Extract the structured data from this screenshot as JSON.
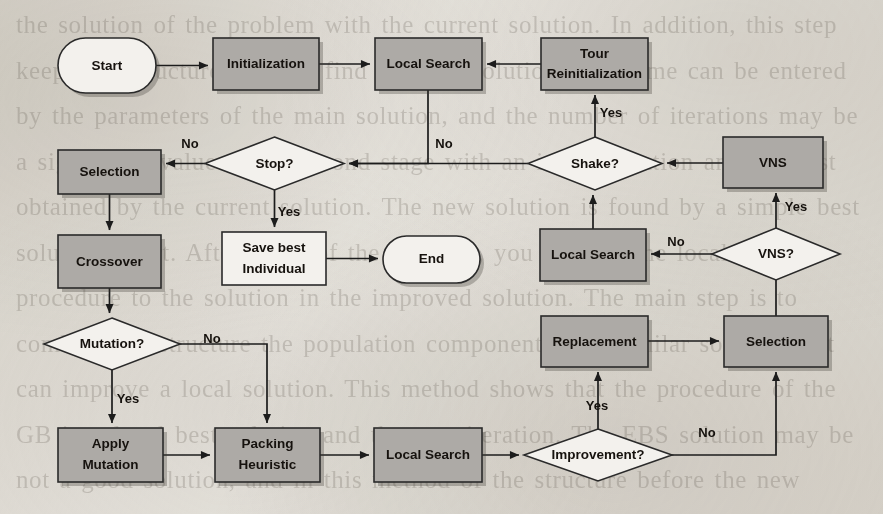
{
  "diagram": {
    "type": "flowchart",
    "background_color": "#eceae5",
    "process_fill_color": "#adaaa6",
    "terminal_fill_color": "#f3f1ed",
    "decision_fill_color": "#f3f1ed",
    "line_color": "#1c1c1c"
  },
  "nodes": [
    {
      "id": "start",
      "label": "Start",
      "shape": "terminal",
      "fill": "white",
      "x": 58,
      "y": 38,
      "w": 98,
      "h": 55
    },
    {
      "id": "init",
      "label": "Initialization",
      "shape": "process",
      "fill": "gray",
      "x": 213,
      "y": 38,
      "w": 106,
      "h": 52
    },
    {
      "id": "ls_top",
      "label": "Local Search",
      "shape": "process",
      "fill": "gray",
      "x": 375,
      "y": 38,
      "w": 107,
      "h": 52
    },
    {
      "id": "tour_reinit",
      "label_line1": "Tour",
      "label_line2": "Reinitialization",
      "label": "Tour Reinitialization",
      "shape": "process",
      "fill": "gray",
      "x": 541,
      "y": 38,
      "w": 107,
      "h": 52
    },
    {
      "id": "selection_l",
      "label": "Selection",
      "shape": "process",
      "fill": "gray",
      "x": 58,
      "y": 150,
      "w": 103,
      "h": 44
    },
    {
      "id": "stop",
      "label": "Stop?",
      "shape": "decision",
      "fill": "white",
      "x": 205,
      "y": 137,
      "w": 139,
      "h": 53
    },
    {
      "id": "shake",
      "label": "Shake?",
      "shape": "decision",
      "fill": "white",
      "x": 528,
      "y": 137,
      "w": 134,
      "h": 53
    },
    {
      "id": "vns",
      "label": "VNS",
      "shape": "process",
      "fill": "gray",
      "x": 723,
      "y": 137,
      "w": 100,
      "h": 51
    },
    {
      "id": "crossover",
      "label": "Crossover",
      "shape": "process",
      "fill": "gray",
      "x": 58,
      "y": 235,
      "w": 103,
      "h": 53
    },
    {
      "id": "save_best",
      "label_line1": "Save best",
      "label_line2": "Individual",
      "label": "Save best Individual",
      "shape": "process",
      "fill": "white",
      "x": 222,
      "y": 232,
      "w": 104,
      "h": 53
    },
    {
      "id": "end",
      "label": "End",
      "shape": "terminal",
      "fill": "white",
      "x": 383,
      "y": 236,
      "w": 97,
      "h": 47
    },
    {
      "id": "ls_mid",
      "label": "Local Search",
      "shape": "process",
      "fill": "gray",
      "x": 540,
      "y": 229,
      "w": 106,
      "h": 52
    },
    {
      "id": "vns_q",
      "label": "VNS?",
      "shape": "decision",
      "fill": "white",
      "x": 712,
      "y": 228,
      "w": 128,
      "h": 52
    },
    {
      "id": "mutation_q",
      "label": "Mutation?",
      "shape": "decision",
      "fill": "white",
      "x": 44,
      "y": 318,
      "w": 136,
      "h": 52
    },
    {
      "id": "replacement",
      "label": "Replacement",
      "shape": "process",
      "fill": "gray",
      "x": 541,
      "y": 316,
      "w": 107,
      "h": 51
    },
    {
      "id": "selection_r",
      "label": "Selection",
      "shape": "process",
      "fill": "gray",
      "x": 724,
      "y": 316,
      "w": 104,
      "h": 51
    },
    {
      "id": "apply_mut",
      "label_line1": "Apply",
      "label_line2": "Mutation",
      "label": "Apply Mutation",
      "shape": "process",
      "fill": "gray",
      "x": 58,
      "y": 428,
      "w": 105,
      "h": 54
    },
    {
      "id": "packing",
      "label_line1": "Packing",
      "label_line2": "Heuristic",
      "label": "Packing Heuristic",
      "shape": "process",
      "fill": "gray",
      "x": 215,
      "y": 428,
      "w": 105,
      "h": 54
    },
    {
      "id": "ls_bot",
      "label": "Local Search",
      "shape": "process",
      "fill": "gray",
      "x": 374,
      "y": 428,
      "w": 108,
      "h": 54
    },
    {
      "id": "improvement",
      "label": "Improvement?",
      "shape": "decision",
      "fill": "white",
      "x": 524,
      "y": 429,
      "w": 148,
      "h": 52
    }
  ],
  "edge_labels": [
    {
      "id": "stop-no",
      "text": "No",
      "x": 190,
      "y": 145
    },
    {
      "id": "stop-yes",
      "text": "Yes",
      "x": 289,
      "y": 213
    },
    {
      "id": "shake-no",
      "text": "No",
      "x": 444,
      "y": 145
    },
    {
      "id": "shake-yes",
      "text": "Yes",
      "x": 611,
      "y": 114
    },
    {
      "id": "vnsq-no",
      "text": "No",
      "x": 676,
      "y": 243
    },
    {
      "id": "vnsq-yes",
      "text": "Yes",
      "x": 796,
      "y": 208
    },
    {
      "id": "mutation-no",
      "text": "No",
      "x": 212,
      "y": 340
    },
    {
      "id": "mutation-yes",
      "text": "Yes",
      "x": 128,
      "y": 400
    },
    {
      "id": "improvement-no",
      "text": "No",
      "x": 707,
      "y": 434
    },
    {
      "id": "improvement-yes",
      "text": "Yes",
      "x": 597,
      "y": 407
    }
  ],
  "edges": [
    {
      "id": "start-init",
      "from": "start",
      "to": "init",
      "label": ""
    },
    {
      "id": "init-ls_top",
      "from": "init",
      "to": "ls_top",
      "label": ""
    },
    {
      "id": "tour_reinit-ls_top",
      "from": "tour_reinit",
      "to": "ls_top",
      "label": ""
    },
    {
      "id": "ls_top-stop",
      "from": "ls_top",
      "to": "stop",
      "label": ""
    },
    {
      "id": "stop-selection_l",
      "from": "stop",
      "to": "selection_l",
      "label": "No"
    },
    {
      "id": "stop-save_best",
      "from": "stop",
      "to": "save_best",
      "label": "Yes"
    },
    {
      "id": "save_best-end",
      "from": "save_best",
      "to": "end",
      "label": ""
    },
    {
      "id": "selection_l-crossover",
      "from": "selection_l",
      "to": "crossover",
      "label": ""
    },
    {
      "id": "crossover-mutation_q",
      "from": "crossover",
      "to": "mutation_q",
      "label": ""
    },
    {
      "id": "mutation_q-apply_mut",
      "from": "mutation_q",
      "to": "apply_mut",
      "label": "Yes"
    },
    {
      "id": "mutation_q-packing",
      "from": "mutation_q",
      "to": "packing",
      "label": "No"
    },
    {
      "id": "apply_mut-packing",
      "from": "apply_mut",
      "to": "packing",
      "label": ""
    },
    {
      "id": "packing-ls_bot",
      "from": "packing",
      "to": "ls_bot",
      "label": ""
    },
    {
      "id": "ls_bot-improvement",
      "from": "ls_bot",
      "to": "improvement",
      "label": ""
    },
    {
      "id": "improvement-replacement",
      "from": "improvement",
      "to": "replacement",
      "label": "Yes"
    },
    {
      "id": "improvement-selection_r",
      "from": "improvement",
      "to": "selection_r",
      "label": "No"
    },
    {
      "id": "replacement-selection_r",
      "from": "replacement",
      "to": "selection_r",
      "label": ""
    },
    {
      "id": "selection_r-vns_q",
      "from": "selection_r",
      "to": "vns_q",
      "label": ""
    },
    {
      "id": "vns_q-vns",
      "from": "vns_q",
      "to": "vns",
      "label": "Yes"
    },
    {
      "id": "vns_q-ls_mid",
      "from": "vns_q",
      "to": "ls_mid",
      "label": "No"
    },
    {
      "id": "vns-shake",
      "from": "vns",
      "to": "shake",
      "label": ""
    },
    {
      "id": "ls_mid-shake",
      "from": "ls_mid",
      "to": "shake",
      "label": ""
    },
    {
      "id": "shake-stop",
      "from": "shake",
      "to": "stop",
      "label": "No"
    },
    {
      "id": "shake-tour_reinit",
      "from": "shake",
      "to": "tour_reinit",
      "label": "Yes"
    }
  ],
  "ghost_text": "the solution of the problem with the current solution. In addition, this step keeps the structure work to find the best solution. The same can be entered by the parameters of the main solution, and the number of iterations may be a significant value using Second stage with an initial solution and the best obtained by the current solution. The new solution is found by a simple best solution effort. After some of the problem, you can use the local search procedure to the solution in the improved solution. The main step is to combine the structure the population components of a similar solution that can improve a local solution. This method shows that the procedure of the GB in a local best solution and the new iteration. The EBS solution may be not a good solution, and in this method of the structure before the new iteration."
}
